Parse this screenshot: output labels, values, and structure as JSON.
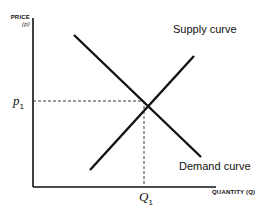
{
  "diagram": {
    "y_axis": {
      "label_line1": "PRICE",
      "label_line2": "(p)"
    },
    "x_axis": {
      "label": "QUANTITY (Q)"
    },
    "curves": [
      {
        "name": "Supply curve",
        "direction": "upward-sloping"
      },
      {
        "name": "Demand curve",
        "direction": "downward-sloping"
      }
    ],
    "equilibrium": {
      "price_label": "p",
      "price_sub": "1",
      "quantity_label": "Q",
      "quantity_sub": "1"
    },
    "colors": {
      "line": "#111111",
      "background": "#ffffff"
    }
  }
}
